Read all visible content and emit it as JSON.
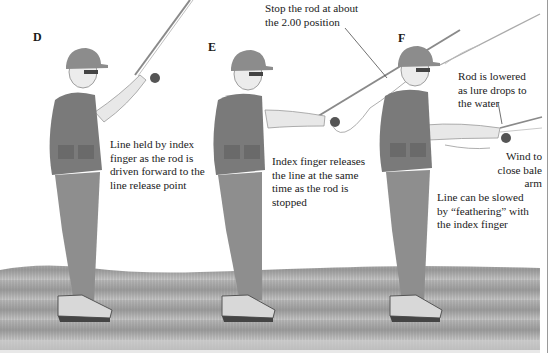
{
  "figures": [
    {
      "step": "D",
      "caption_lines": [
        "Line held by index",
        "finger as the rod is",
        "driven forward to the",
        "line release point"
      ]
    },
    {
      "step": "E",
      "caption_lines": [
        "Index finger releases",
        "the line at the same",
        "time as the rod is",
        "stopped"
      ],
      "callout_lines": [
        "Stop the rod at about",
        "the 2.00 position"
      ]
    },
    {
      "step": "F",
      "callouts": [
        {
          "lines": [
            "Rod is lowered",
            "as lure drops to",
            "the water"
          ]
        },
        {
          "lines": [
            "Wind to",
            "close bale",
            "arm"
          ]
        },
        {
          "lines": [
            "Line can be slowed",
            "by “feathering” with",
            "the index finger"
          ]
        }
      ]
    }
  ],
  "colors": {
    "grass": "#8a8a8a",
    "figure": "#7a7a7a",
    "text": "#1a1a1a",
    "border": "#9a9a9a"
  }
}
